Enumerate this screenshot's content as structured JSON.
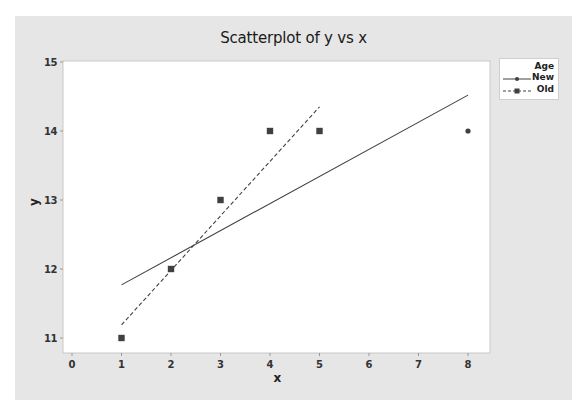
{
  "chart_data": {
    "type": "scatter",
    "title": "Scatterplot of y vs x",
    "xlabel": "x",
    "ylabel": "y",
    "xlim": [
      0,
      8
    ],
    "ylim": [
      11,
      15
    ],
    "xticks": [
      0,
      1,
      2,
      3,
      4,
      5,
      6,
      7,
      8
    ],
    "yticks": [
      11,
      12,
      13,
      14,
      15
    ],
    "grid": false,
    "legend": {
      "title": "Age",
      "position": "top-right",
      "entries": [
        {
          "label": "New",
          "marker": "circle",
          "line": "solid"
        },
        {
          "label": "Old",
          "marker": "square",
          "line": "dashed"
        }
      ]
    },
    "series": [
      {
        "name": "New",
        "marker": "circle",
        "points": [
          {
            "x": 8,
            "y": 14
          }
        ],
        "fit_line": {
          "style": "solid",
          "x": [
            1,
            8
          ],
          "y": [
            11.77,
            14.52
          ]
        }
      },
      {
        "name": "Old",
        "marker": "square",
        "points": [
          {
            "x": 1,
            "y": 11
          },
          {
            "x": 2,
            "y": 12
          },
          {
            "x": 3,
            "y": 13
          },
          {
            "x": 4,
            "y": 14
          },
          {
            "x": 5,
            "y": 14
          }
        ],
        "fit_line": {
          "style": "dashed",
          "x": [
            1,
            5
          ],
          "y": [
            11.19,
            14.35
          ]
        }
      }
    ]
  },
  "colors": {
    "panel_bg": "#e6e6e6",
    "plot_bg": "#ffffff",
    "series": "#404040",
    "text": "#1a1a1a"
  }
}
